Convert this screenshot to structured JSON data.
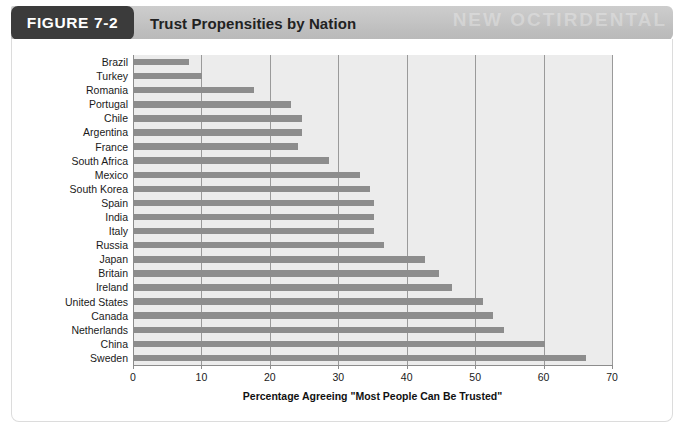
{
  "figure": {
    "tag_label": "FIGURE 7-2",
    "title": "Trust Propensities by Nation",
    "header_ghost_text": "NEW OCTIRDENTAL",
    "tag_bg_color": "#3b3b3b",
    "header_bg_color": "#c4c4c4",
    "plot_bg_color": "#ececec",
    "bar_color": "#8d8d8d",
    "gridline_color": "#9a9a9a"
  },
  "chart_data": {
    "type": "bar",
    "orientation": "horizontal",
    "title": "Trust Propensities by Nation",
    "xlabel": "Percentage Agreeing \"Most People Can Be Trusted\"",
    "ylabel": "",
    "xlim": [
      0,
      70
    ],
    "xticks": [
      0,
      10,
      20,
      30,
      40,
      50,
      60,
      70
    ],
    "xtick_labels": [
      "0",
      "10",
      "20",
      "30",
      "40",
      "50",
      "60",
      "70"
    ],
    "grid": "vertical",
    "legend": "none",
    "categories": [
      "Brazil",
      "Turkey",
      "Romania",
      "Portugal",
      "Chile",
      "Argentina",
      "France",
      "South Africa",
      "Mexico",
      "South Korea",
      "Spain",
      "India",
      "Italy",
      "Russia",
      "Japan",
      "Britain",
      "Ireland",
      "United States",
      "Canada",
      "Netherlands",
      "China",
      "Sweden"
    ],
    "values": [
      8,
      10,
      17.5,
      23,
      24.5,
      24.5,
      24,
      28.5,
      33,
      34.5,
      35,
      35,
      35,
      36.5,
      42.5,
      44.5,
      46.5,
      51,
      52.5,
      54,
      60,
      66
    ]
  }
}
